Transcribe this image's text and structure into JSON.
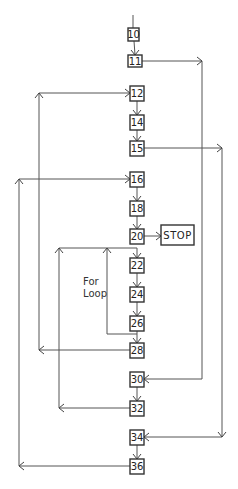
{
  "nodes": [
    {
      "id": "10",
      "label": "10",
      "x": 128,
      "y": 28,
      "w": 11,
      "h": 13
    },
    {
      "id": "11",
      "label": "11",
      "x": 128,
      "y": 55,
      "w": 14,
      "h": 12
    },
    {
      "id": "12",
      "label": "12",
      "x": 130,
      "y": 86,
      "w": 14,
      "h": 15
    },
    {
      "id": "14",
      "label": "14",
      "x": 130,
      "y": 115,
      "w": 14,
      "h": 15
    },
    {
      "id": "15",
      "label": "15",
      "x": 130,
      "y": 141,
      "w": 14,
      "h": 15
    },
    {
      "id": "16",
      "label": "16",
      "x": 130,
      "y": 172,
      "w": 14,
      "h": 15
    },
    {
      "id": "18",
      "label": "18",
      "x": 130,
      "y": 201,
      "w": 14,
      "h": 15
    },
    {
      "id": "20",
      "label": "20",
      "x": 130,
      "y": 229,
      "w": 14,
      "h": 15
    },
    {
      "id": "stop",
      "label": "STOP",
      "x": 161,
      "y": 225,
      "w": 33,
      "h": 20
    },
    {
      "id": "22",
      "label": "22",
      "x": 130,
      "y": 258,
      "w": 14,
      "h": 15
    },
    {
      "id": "24",
      "label": "24",
      "x": 130,
      "y": 287,
      "w": 14,
      "h": 15
    },
    {
      "id": "26",
      "label": "26",
      "x": 130,
      "y": 316,
      "w": 14,
      "h": 15
    },
    {
      "id": "28",
      "label": "28",
      "x": 130,
      "y": 343,
      "w": 14,
      "h": 15
    },
    {
      "id": "30",
      "label": "30",
      "x": 130,
      "y": 372,
      "w": 14,
      "h": 15
    },
    {
      "id": "32",
      "label": "32",
      "x": 130,
      "y": 401,
      "w": 14,
      "h": 15
    },
    {
      "id": "34",
      "label": "34",
      "x": 130,
      "y": 430,
      "w": 14,
      "h": 15
    },
    {
      "id": "36",
      "label": "36",
      "x": 130,
      "y": 459,
      "w": 14,
      "h": 15
    }
  ],
  "edges": [
    {
      "from": "entry",
      "to": "10"
    },
    {
      "from": "10",
      "to": "11"
    },
    {
      "from": "11",
      "to": "30",
      "route": "right-outer"
    },
    {
      "from": "12",
      "to": "14"
    },
    {
      "from": "14",
      "to": "15"
    },
    {
      "from": "15",
      "to": "34",
      "route": "right-outermost"
    },
    {
      "from": "16",
      "to": "18"
    },
    {
      "from": "18",
      "to": "20"
    },
    {
      "from": "20",
      "to": "stop"
    },
    {
      "from": "22",
      "to": "24"
    },
    {
      "from": "24",
      "to": "26"
    },
    {
      "from": "26",
      "to": "22",
      "route": "inner-loop"
    },
    {
      "from": "26",
      "to": "28"
    },
    {
      "from": "28",
      "to": "12",
      "route": "left-loop"
    },
    {
      "from": "30",
      "to": "32"
    },
    {
      "from": "32",
      "to": "22",
      "route": "left-mid-loop"
    },
    {
      "from": "34",
      "to": "36"
    },
    {
      "from": "36",
      "to": "16",
      "route": "left-outer-loop"
    }
  ],
  "annotation": {
    "line1": "For",
    "line2": "Loop"
  }
}
